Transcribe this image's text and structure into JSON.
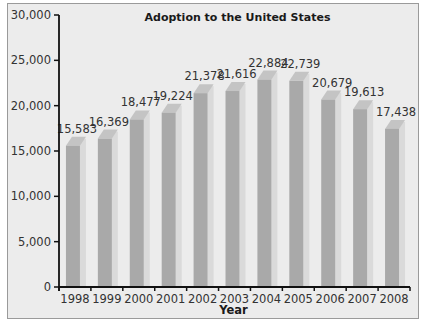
{
  "chart_data": {
    "type": "bar",
    "title": "Adoption to the United States",
    "xlabel": "Year",
    "ylabel": "",
    "categories": [
      "1998",
      "1999",
      "2000",
      "2001",
      "2002",
      "2003",
      "2004",
      "2005",
      "2006",
      "2007",
      "2008"
    ],
    "values": [
      15583,
      16369,
      18477,
      19224,
      21378,
      21616,
      22884,
      22739,
      20679,
      19613,
      17438
    ],
    "value_labels": [
      "15,583",
      "16,369",
      "18,477",
      "19,224",
      "21,378",
      "21,616",
      "22,884",
      "22,739",
      "20,679",
      "19,613",
      "17,438"
    ],
    "ylim": [
      0,
      30000
    ],
    "yticks": [
      0,
      5000,
      10000,
      15000,
      20000,
      25000,
      30000
    ],
    "ytick_labels": [
      "0",
      "5,000",
      "10,000",
      "15,000",
      "20,000",
      "25,000",
      "30,000"
    ],
    "grid": false,
    "legend": null,
    "style": "3d-bars",
    "colors": {
      "background": "#ececec",
      "bar_front": "#a9a9a9",
      "bar_top": "#c4c4c4",
      "bar_side": "#dadada",
      "axis": "#111111"
    }
  }
}
